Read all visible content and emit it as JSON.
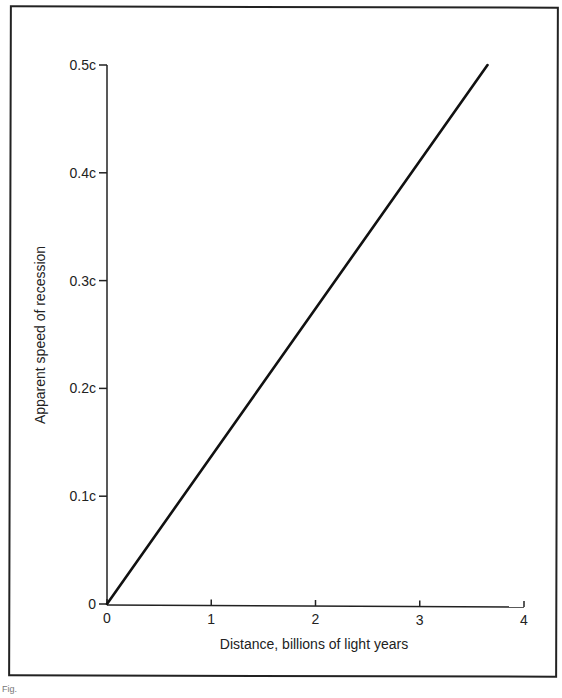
{
  "chart_data": {
    "type": "line",
    "title": "",
    "xlabel": "Distance, billions of light years",
    "ylabel": "Apparent speed of recession",
    "xlim": [
      0,
      4
    ],
    "ylim": [
      0,
      0.5
    ],
    "x_ticks": [
      "0",
      "1",
      "2",
      "3",
      "4"
    ],
    "y_ticks": [
      "0",
      "0.1c",
      "0.2c",
      "0.3c",
      "0.4c",
      "0.5c"
    ],
    "grid": false,
    "legend": null,
    "series": [
      {
        "name": "Hubble relation",
        "x": [
          0,
          3.65
        ],
        "y": [
          0,
          0.5
        ]
      }
    ]
  },
  "caption_fragment": "Fig."
}
